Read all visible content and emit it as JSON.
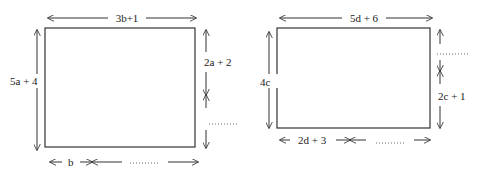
{
  "figures": [
    {
      "id": "rectangle-1",
      "top_label": "3b+1",
      "left_label": "5a + 4",
      "right_upper_label": "2a + 2",
      "right_lower_label": "………",
      "bottom_left_label": "b",
      "bottom_right_label": "………"
    },
    {
      "id": "rectangle-2",
      "top_label": "5d + 6",
      "left_label": "4c",
      "right_upper_label": "………",
      "right_lower_label": "2c + 1",
      "bottom_left_label": "2d + 3",
      "bottom_right_label": "………"
    }
  ],
  "colors": {
    "line": "#333333",
    "text": "#222222",
    "background": "#ffffff"
  }
}
